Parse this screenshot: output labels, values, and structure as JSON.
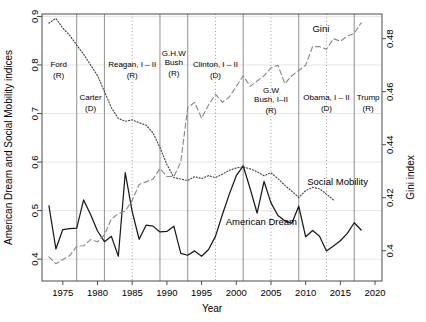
{
  "chart_data": {
    "type": "line",
    "title": "",
    "xlabel": "Year",
    "ylabel": "American Dream and Social Mobility indices",
    "ylabel_right": "Gini index",
    "xlim": [
      1972.0,
      2021.0
    ],
    "ylim": [
      0.355,
      0.905
    ],
    "ylim_right": [
      0.3886,
      0.4893
    ],
    "grid": true,
    "legend": "inline-annotations",
    "xticks": [
      1975,
      1980,
      1985,
      1990,
      1995,
      2000,
      2005,
      2010,
      2015,
      2020
    ],
    "xtick_labels": [
      "1975",
      "1980",
      "1985",
      "1990",
      "1995",
      "2000",
      "2005",
      "2010",
      "2015",
      "2020"
    ],
    "yticks": [
      0.4,
      0.5,
      0.6,
      0.7,
      0.8,
      0.9
    ],
    "ytick_labels": [
      "0.4",
      "0.5",
      "0.6",
      "0.7",
      "0.8",
      "0.9"
    ],
    "yticks_right": [
      0.4,
      0.42,
      0.44,
      0.46,
      0.48
    ],
    "ytick_labels_right": [
      "0.4",
      "0.42",
      "0.44",
      "0.46",
      "0.48"
    ],
    "series": [
      {
        "name": "American Dream",
        "style": "solid",
        "color": "#1a1a1a",
        "axis": "left",
        "x": [
          1973,
          1974,
          1975,
          1976,
          1977,
          1978,
          1979,
          1980,
          1981,
          1982,
          1983,
          1984,
          1985,
          1986,
          1987,
          1988,
          1989,
          1990,
          1991,
          1992,
          1993,
          1994,
          1995,
          1996,
          1997,
          1998,
          1999,
          2000,
          2001,
          2002,
          2003,
          2004,
          2005,
          2006,
          2007,
          2008,
          2009,
          2010,
          2011,
          2012,
          2013,
          2014,
          2015,
          2016,
          2017,
          2018
        ],
        "y": [
          0.51,
          0.421,
          0.461,
          0.463,
          0.464,
          0.522,
          0.492,
          0.458,
          0.436,
          0.447,
          0.406,
          0.578,
          0.498,
          0.441,
          0.47,
          0.468,
          0.456,
          0.457,
          0.468,
          0.412,
          0.408,
          0.417,
          0.406,
          0.42,
          0.447,
          0.492,
          0.534,
          0.572,
          0.592,
          0.545,
          0.495,
          0.56,
          0.516,
          0.49,
          0.479,
          0.474,
          0.509,
          0.446,
          0.459,
          0.447,
          0.417,
          0.427,
          0.438,
          0.453,
          0.475,
          0.46
        ]
      },
      {
        "name": "Social Mobility",
        "style": "dotted",
        "color": "#444444",
        "axis": "left",
        "x": [
          1973,
          1974,
          1975,
          1976,
          1977,
          1978,
          1979,
          1980,
          1981,
          1982,
          1983,
          1984,
          1985,
          1986,
          1987,
          1988,
          1989,
          1990,
          1991,
          1992,
          1993,
          1994,
          1995,
          1996,
          1997,
          1998,
          1999,
          2000,
          2001,
          2002,
          2003,
          2004,
          2005,
          2006,
          2007,
          2008,
          2009,
          2010,
          2011,
          2012,
          2013,
          2014
        ],
        "y": [
          0.886,
          0.896,
          0.876,
          0.861,
          0.841,
          0.822,
          0.8,
          0.778,
          0.745,
          0.712,
          0.69,
          0.684,
          0.687,
          0.681,
          0.676,
          0.66,
          0.63,
          0.595,
          0.568,
          0.565,
          0.562,
          0.57,
          0.566,
          0.572,
          0.568,
          0.575,
          0.583,
          0.588,
          0.59,
          0.586,
          0.58,
          0.572,
          0.578,
          0.566,
          0.552,
          0.54,
          0.527,
          0.541,
          0.548,
          0.545,
          0.534,
          0.522
        ]
      },
      {
        "name": "Gini",
        "style": "dashed",
        "color": "#8a8a8a",
        "axis": "right",
        "x": [
          1973,
          1974,
          1975,
          1976,
          1977,
          1978,
          1979,
          1980,
          1981,
          1982,
          1983,
          1984,
          1985,
          1986,
          1987,
          1988,
          1989,
          1990,
          1991,
          1992,
          1993,
          1994,
          1995,
          1996,
          1997,
          1998,
          1999,
          2000,
          2001,
          2002,
          2003,
          2004,
          2005,
          2006,
          2007,
          2008,
          2009,
          2010,
          2011,
          2012,
          2013,
          2014,
          2015,
          2016,
          2017,
          2018
        ],
        "y": [
          0.3977,
          0.3951,
          0.3967,
          0.3982,
          0.4017,
          0.4019,
          0.4042,
          0.4034,
          0.406,
          0.412,
          0.414,
          0.415,
          0.419,
          0.425,
          0.426,
          0.427,
          0.431,
          0.428,
          0.428,
          0.4335,
          0.454,
          0.456,
          0.45,
          0.455,
          0.459,
          0.456,
          0.458,
          0.462,
          0.466,
          0.462,
          0.464,
          0.466,
          0.469,
          0.47,
          0.463,
          0.466,
          0.468,
          0.47,
          0.477,
          0.477,
          0.476,
          0.48,
          0.479,
          0.481,
          0.482,
          0.486
        ]
      }
    ],
    "presidents": [
      {
        "name": "Ford",
        "party": "(R)",
        "start": 1972.0,
        "end": 1977.0,
        "label_x": 1974.4,
        "label_y": 0.795,
        "boundary": 1977.0,
        "boundary_style": "solid"
      },
      {
        "name": "Carter",
        "party": "(D)",
        "start": 1977.0,
        "end": 1981.0,
        "label_x": 1979.0,
        "label_y": 0.727,
        "boundary": 1981.0,
        "boundary_style": "solid"
      },
      {
        "name": "Reagan, I – II",
        "party": "(R)",
        "start": 1981.0,
        "end": 1989.0,
        "label_x": 1985.0,
        "label_y": 0.795,
        "boundary": 1989.0,
        "boundary_style": "solid",
        "midterm": 1985.0
      },
      {
        "name": "G.H.W\nBush",
        "party": "(R)",
        "start": 1989.0,
        "end": 1993.0,
        "label_x": 1991.0,
        "label_y": 0.818,
        "boundary": 1993.0,
        "boundary_style": "solid"
      },
      {
        "name": "Clinton, I – II",
        "party": "(D)",
        "start": 1993.0,
        "end": 2001.0,
        "label_x": 1997.0,
        "label_y": 0.795,
        "boundary": 2001.0,
        "boundary_style": "solid",
        "midterm": 1997.0
      },
      {
        "name": "G.W\nBush, I–II",
        "party": "(R)",
        "start": 2001.0,
        "end": 2009.0,
        "label_x": 2005.0,
        "label_y": 0.742,
        "boundary": 2009.0,
        "boundary_style": "solid",
        "midterm": 2005.0
      },
      {
        "name": "Obama, I – II",
        "party": "(D)",
        "start": 2009.0,
        "end": 2017.0,
        "label_x": 2013.0,
        "label_y": 0.728,
        "boundary": 2017.0,
        "boundary_style": "solid",
        "midterm": 2013.0
      },
      {
        "name": "Trump",
        "party": "(R)",
        "start": 2017.0,
        "end": 2021.0,
        "label_x": 2019.0,
        "label_y": 0.728,
        "boundary": null,
        "boundary_style": "solid"
      }
    ],
    "annotations": [
      {
        "text": "Gini",
        "x": 2012.2,
        "y": 0.867,
        "series": "Gini"
      },
      {
        "text": "Social Mobility",
        "x": 2014.6,
        "y": 0.553,
        "series": "Social Mobility"
      },
      {
        "text": "American Dream",
        "x": 2003.6,
        "y": 0.47,
        "series": "American Dream"
      }
    ]
  },
  "axes": {
    "y_left_title": "American Dream and Social Mobility indices",
    "y_right_title": "Gini index",
    "x_title": "Year"
  },
  "colors": {
    "american_dream": "#1a1a1a",
    "social_mobility": "#444444",
    "gini": "#8a8a8a",
    "grid": "#dddddd",
    "boundary": "#9a9a9a",
    "axis": "#4d4d4d",
    "background": "#ffffff"
  }
}
